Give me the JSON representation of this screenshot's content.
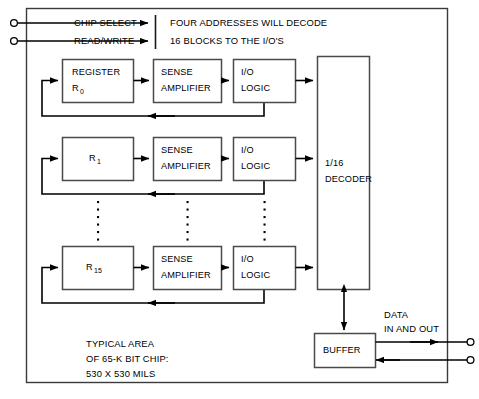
{
  "diagram": {
    "colors": {
      "ink": "#000000",
      "block_stroke": "#4a4a4a",
      "boundary_stroke": "#3a3a3a",
      "background": "#ffffff"
    },
    "inputs": [
      {
        "id": "chip-select",
        "label": "CHIP SELECT"
      },
      {
        "id": "read-write",
        "label": "READ/WRITE"
      }
    ],
    "annotation": {
      "line1": "FOUR ADDRESSES WILL DECODE",
      "line2": "16 BLOCKS TO THE I/O'S"
    },
    "rows": [
      {
        "id": "row-0",
        "register": {
          "line1": "REGISTER",
          "line2": "R",
          "subscript": "0"
        },
        "sense": {
          "line1": "SENSE",
          "line2": "AMPLIFIER"
        },
        "iologic": {
          "line1": "I/O",
          "line2": "LOGIC"
        }
      },
      {
        "id": "row-1",
        "register": {
          "line1": "",
          "line2": "R",
          "subscript": "1"
        },
        "sense": {
          "line1": "SENSE",
          "line2": "AMPLIFIER"
        },
        "iologic": {
          "line1": "I/O",
          "line2": "LOGIC"
        }
      },
      {
        "id": "row-15",
        "register": {
          "line1": "",
          "line2": "R",
          "subscript": "15"
        },
        "sense": {
          "line1": "SENSE",
          "line2": "AMPLIFIER"
        },
        "iologic": {
          "line1": "I/O",
          "line2": "LOGIC"
        }
      }
    ],
    "decoder": {
      "line1": "1/16",
      "line2": "DECODER"
    },
    "buffer": {
      "label": "BUFFER"
    },
    "data_port": {
      "line1": "DATA",
      "line2": "IN AND OUT"
    },
    "chip_note": {
      "line1": "TYPICAL AREA",
      "line2": "OF 65-K BIT CHIP:",
      "line3": "530 X 530 MILS"
    },
    "ellipsis_columns": 3,
    "ellipsis_dots_per_column": 8
  }
}
